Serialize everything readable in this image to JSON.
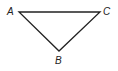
{
  "diagram": {
    "type": "triangle",
    "stroke_color": "#222222",
    "vertices": [
      {
        "label": "A",
        "x": 19,
        "y": 12
      },
      {
        "label": "C",
        "x": 100,
        "y": 12
      },
      {
        "label": "B",
        "x": 59,
        "y": 51
      }
    ],
    "edges": [
      [
        "A",
        "C"
      ],
      [
        "C",
        "B"
      ],
      [
        "B",
        "A"
      ]
    ]
  }
}
